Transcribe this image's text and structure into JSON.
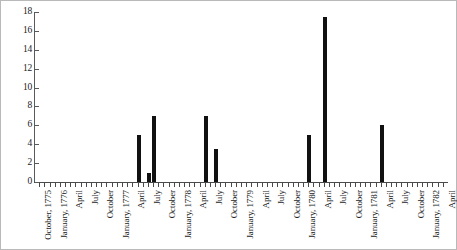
{
  "chart_data": {
    "type": "bar",
    "title": "",
    "subtitle": "",
    "xlabel": "",
    "ylabel": "",
    "ylim": [
      0,
      18
    ],
    "ytick_step": 2,
    "ytick_labels": [
      "0",
      "2",
      "4",
      "6",
      "8",
      "10",
      "12",
      "14",
      "16",
      "18"
    ],
    "grid": false,
    "legend": false,
    "x_axis_start": "October, 1775",
    "x_axis_end": "April, 1782",
    "x_tick_interval": "monthly",
    "x_label_interval": "quarterly",
    "categories": [
      "October, 1775",
      "November, 1775",
      "December, 1775",
      "January, 1776",
      "February, 1776",
      "March, 1776",
      "April, 1776",
      "May, 1776",
      "June, 1776",
      "July, 1776",
      "August, 1776",
      "September, 1776",
      "October, 1776",
      "November, 1776",
      "December, 1776",
      "January, 1777",
      "February, 1777",
      "March, 1777",
      "April, 1777",
      "May, 1777",
      "June, 1777",
      "July, 1777",
      "August, 1777",
      "September, 1777",
      "October, 1777",
      "November, 1777",
      "December, 1777",
      "January, 1778",
      "February, 1778",
      "March, 1778",
      "April, 1778",
      "May, 1778",
      "June, 1778",
      "July, 1778",
      "August, 1778",
      "September, 1778",
      "October, 1778",
      "November, 1778",
      "December, 1778",
      "January, 1779",
      "February, 1779",
      "March, 1779",
      "April, 1779",
      "May, 1779",
      "June, 1779",
      "July, 1779",
      "August, 1779",
      "September, 1779",
      "October, 1779",
      "November, 1779",
      "December, 1779",
      "January, 1780",
      "February, 1780",
      "March, 1780",
      "April, 1780",
      "May, 1780",
      "June, 1780",
      "July, 1780",
      "August, 1780",
      "September, 1780",
      "October, 1780",
      "November, 1780",
      "December, 1780",
      "January, 1781",
      "February, 1781",
      "March, 1781",
      "April, 1781",
      "May, 1781",
      "June, 1781",
      "July, 1781",
      "August, 1781",
      "September, 1781",
      "October, 1781",
      "November, 1781",
      "December, 1781",
      "January, 1782",
      "February, 1782",
      "March, 1782",
      "April, 1782"
    ],
    "values": [
      0,
      0,
      0,
      0,
      0,
      0,
      0,
      0,
      0,
      0,
      0,
      0,
      0,
      0,
      0,
      0,
      0,
      0,
      0,
      5,
      0,
      1,
      7,
      0,
      0,
      0,
      0,
      0,
      0,
      0,
      0,
      0,
      7,
      0,
      3.5,
      0,
      0,
      0,
      0,
      0,
      0,
      0,
      0,
      0,
      0,
      0,
      0,
      0,
      0,
      0,
      0,
      0,
      5,
      0,
      0,
      17.5,
      0,
      0,
      0,
      0,
      0,
      0,
      0,
      0,
      0,
      0,
      6,
      0,
      0,
      0,
      0,
      0,
      0,
      0,
      0,
      0,
      0,
      0,
      0
    ],
    "labeled_ticks": [
      "October, 1775",
      "January, 1776",
      "April",
      "July",
      "October",
      "January, 1777",
      "April",
      "July",
      "October",
      "January, 1778",
      "April",
      "July",
      "October",
      "January, 1779",
      "April",
      "July",
      "October",
      "January, 1780",
      "April",
      "July",
      "October",
      "January, 1781",
      "April",
      "July",
      "October",
      "January, 1782",
      "April"
    ],
    "bar_color": "#111111",
    "axis_color": "#4a4a4a",
    "background_color": "#ffffff",
    "frame_color": "#b9b9b9"
  }
}
